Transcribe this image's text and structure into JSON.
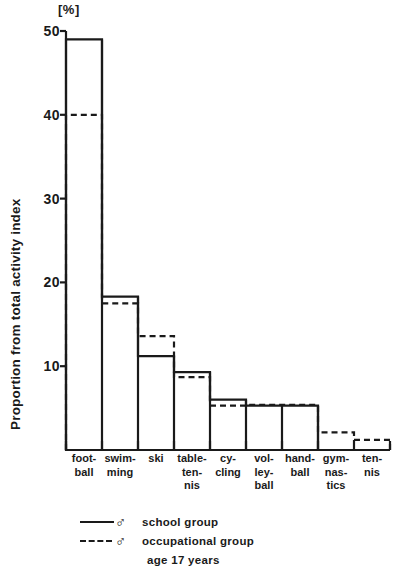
{
  "chart_data": {
    "type": "bar",
    "title": "",
    "subtitle": "",
    "xlabel": "",
    "ylabel": "Proportion from total activity index",
    "yunit": "[%]",
    "ylim": [
      0,
      50
    ],
    "yticks": [
      10,
      20,
      30,
      40,
      50
    ],
    "ytick_labels": [
      "10",
      "20",
      "30",
      "40",
      "50"
    ],
    "grid": false,
    "legend_position": "bottom-left",
    "categories": [
      "foot-ball",
      "swim-ming",
      "ski",
      "table-ten-nis",
      "cy-cling",
      "vol-ley-ball",
      "hand-ball",
      "gym-nas-tics",
      "ten-nis"
    ],
    "category_label_lines": [
      [
        "foot-",
        "ball"
      ],
      [
        "swim-",
        "ming"
      ],
      [
        "ski"
      ],
      [
        "table-",
        "ten-",
        "nis"
      ],
      [
        "cy-",
        "cling"
      ],
      [
        "vol-",
        "ley-",
        "ball"
      ],
      [
        "hand-",
        "ball"
      ],
      [
        "gym-",
        "nas-",
        "tics"
      ],
      [
        "ten-",
        "nis"
      ]
    ],
    "series": [
      {
        "name": "school group",
        "style": "solid",
        "values": [
          49.0,
          18.3,
          11.2,
          9.3,
          6.0,
          5.3,
          5.3,
          0.0,
          0.0
        ]
      },
      {
        "name": "occupational group",
        "style": "dashed",
        "values": [
          40.0,
          17.5,
          13.6,
          8.7,
          5.3,
          5.4,
          5.4,
          2.1,
          1.2
        ]
      }
    ]
  },
  "legend": {
    "entries": [
      {
        "symbol": "♂",
        "label": "school group",
        "style": "solid"
      },
      {
        "symbol": "♂",
        "label": "occupational group",
        "style": "dashed"
      }
    ],
    "note": "age 17 years"
  }
}
